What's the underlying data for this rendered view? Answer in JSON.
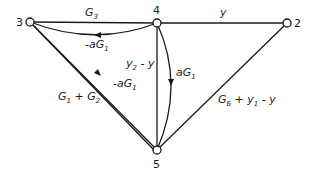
{
  "diagram": {
    "type": "signal-flow-graph",
    "nodes": [
      {
        "id": "3",
        "label": "3",
        "x": 30,
        "y": 22
      },
      {
        "id": "4",
        "label": "4",
        "x": 157,
        "y": 23
      },
      {
        "id": "2",
        "label": "2",
        "x": 287,
        "y": 23
      },
      {
        "id": "5",
        "label": "5",
        "x": 157,
        "y": 150
      }
    ],
    "edges": [
      {
        "from": "3",
        "to": "4",
        "label": "G3",
        "label_main": "G",
        "label_sub": "3"
      },
      {
        "from": "4",
        "to": "2",
        "label": "y",
        "label_main": "y",
        "label_sub": ""
      },
      {
        "from": "4",
        "to": "3",
        "label": "-aG1",
        "label_main": "-aG",
        "label_sub": "1",
        "curved": true
      },
      {
        "from": "4",
        "to": "5",
        "label": "y2 - y",
        "label_main": "y",
        "label_sub": "2",
        "label_tail": " - y"
      },
      {
        "from": "4",
        "to": "5",
        "label": "aG1",
        "label_main": "aG",
        "label_sub": "1",
        "curved": true
      },
      {
        "from": "3",
        "to": "5",
        "label": "-aG1",
        "label_main": "-aG",
        "label_sub": "1",
        "arrow": true
      },
      {
        "from": "3",
        "to": "5",
        "label": "G1 + G2"
      },
      {
        "from": "2",
        "to": "5",
        "label": "G6 + y1 - y"
      }
    ]
  }
}
